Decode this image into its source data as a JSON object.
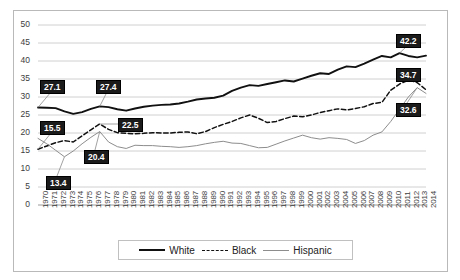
{
  "chart_data": {
    "type": "line",
    "title": "",
    "xlabel": "",
    "ylabel": "",
    "ylim": [
      0,
      50
    ],
    "ytick_step": 5,
    "grid": true,
    "legend_position": "bottom",
    "yticks": [
      "0",
      "5",
      "10",
      "15",
      "20",
      "25",
      "30",
      "35",
      "40",
      "45",
      "50"
    ],
    "x": [
      "1970",
      "1971",
      "1972",
      "1973",
      "1974",
      "1975",
      "1976",
      "1977",
      "1978",
      "1979",
      "1980",
      "1981",
      "1982",
      "1983",
      "1984",
      "1985",
      "1986",
      "1987",
      "1988",
      "1989",
      "1990",
      "1991",
      "1992",
      "1993",
      "1994",
      "1995",
      "1996",
      "1997",
      "1998",
      "1999",
      "2000",
      "2001",
      "2002",
      "2003",
      "2004",
      "2005",
      "2006",
      "2007",
      "2008",
      "2009",
      "2010",
      "2011",
      "2012",
      "2013",
      "2014"
    ],
    "series": [
      {
        "name": "White",
        "style": "solid-thick",
        "color": "#111111",
        "values": [
          27.1,
          27.0,
          26.9,
          26.0,
          25.3,
          25.8,
          26.7,
          27.4,
          27.2,
          26.6,
          26.2,
          26.8,
          27.3,
          27.6,
          27.8,
          27.9,
          28.2,
          28.7,
          29.3,
          29.6,
          29.8,
          30.4,
          31.7,
          32.6,
          33.3,
          33.1,
          33.6,
          34.1,
          34.6,
          34.3,
          35.1,
          35.9,
          36.6,
          36.4,
          37.6,
          38.5,
          38.3,
          39.3,
          40.4,
          41.4,
          41.0,
          42.2,
          41.4,
          41.0,
          41.5
        ]
      },
      {
        "name": "Black",
        "style": "dashed",
        "color": "#111111",
        "values": [
          15.5,
          16.4,
          17.3,
          17.9,
          17.5,
          19.2,
          20.9,
          22.5,
          21.0,
          20.1,
          19.9,
          19.8,
          19.9,
          20.1,
          20.0,
          20.0,
          20.2,
          20.3,
          19.8,
          20.4,
          21.5,
          22.4,
          23.2,
          24.2,
          25.0,
          24.1,
          22.9,
          23.2,
          24.0,
          24.7,
          24.5,
          25.0,
          25.7,
          26.2,
          26.7,
          26.4,
          26.8,
          27.3,
          28.2,
          28.5,
          31.9,
          33.6,
          34.7,
          34.0,
          32.0
        ]
      },
      {
        "name": "Hispanic",
        "style": "solid-thin",
        "color": "#8d8d8d",
        "values": [
          18.5,
          17.0,
          15.2,
          13.4,
          15.0,
          17.0,
          18.8,
          20.4,
          17.5,
          16.2,
          15.7,
          16.6,
          16.5,
          16.5,
          16.3,
          16.2,
          16.0,
          16.2,
          16.5,
          17.0,
          17.4,
          17.7,
          17.2,
          17.1,
          16.5,
          15.9,
          16.0,
          16.9,
          17.8,
          18.6,
          19.4,
          18.7,
          18.3,
          18.7,
          18.5,
          18.2,
          17.1,
          17.9,
          19.4,
          20.3,
          23.2,
          26.6,
          30.0,
          32.6,
          31.0
        ]
      }
    ],
    "annotations": [
      {
        "text": "27.1",
        "series": "White",
        "year": "1970",
        "value": 27.1
      },
      {
        "text": "27.4",
        "series": "White",
        "year": "1977",
        "value": 27.4
      },
      {
        "text": "15.5",
        "series": "Black",
        "year": "1970",
        "value": 15.5
      },
      {
        "text": "22.5",
        "series": "Black",
        "year": "1977",
        "value": 22.5
      },
      {
        "text": "13.4",
        "series": "Hispanic",
        "year": "1973",
        "value": 13.4
      },
      {
        "text": "20.4",
        "series": "Hispanic",
        "year": "1977",
        "value": 20.4
      },
      {
        "text": "42.2",
        "series": "White",
        "year": "2011",
        "value": 42.2
      },
      {
        "text": "34.7",
        "series": "Black",
        "year": "2012",
        "value": 34.7
      },
      {
        "text": "32.6",
        "series": "Hispanic",
        "year": "2013",
        "value": 32.6
      }
    ],
    "legend": [
      {
        "label": "White",
        "key": "solid-thick"
      },
      {
        "label": "Black",
        "key": "dashed"
      },
      {
        "label": "Hispanic",
        "key": "solid-thin"
      }
    ]
  }
}
